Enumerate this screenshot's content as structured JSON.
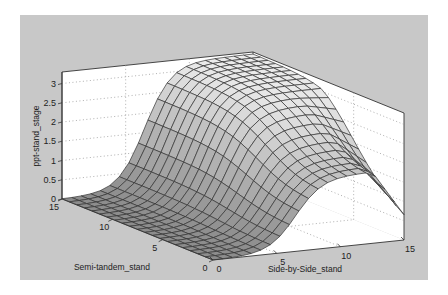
{
  "chart_data": {
    "type": "surface3d",
    "title": "",
    "xlabel": "Side-by-Side_stand",
    "ylabel": "Semi-tandem_stand",
    "zlabel": "ppt-stand_stage",
    "xlim": [
      0,
      15
    ],
    "ylim": [
      0,
      15
    ],
    "zlim": [
      0,
      3.3
    ],
    "x_ticks": [
      "0",
      "5",
      "10",
      "15"
    ],
    "y_ticks": [
      "0",
      "5",
      "10",
      "15"
    ],
    "z_ticks": [
      "0",
      "0.5",
      "1",
      "1.5",
      "2",
      "2.5",
      "3"
    ],
    "grid": true,
    "grid_style": "dotted",
    "grid_resolution": 21,
    "sample_values": [
      {
        "side_by_side": 0,
        "semi_tandem": 0,
        "z": 0.0
      },
      {
        "side_by_side": 0,
        "semi_tandem": 15,
        "z": 0.0
      },
      {
        "side_by_side": 5,
        "semi_tandem": 5,
        "z": 0.3
      },
      {
        "side_by_side": 7.5,
        "semi_tandem": 10,
        "z": 1.6
      },
      {
        "side_by_side": 10,
        "semi_tandem": 15,
        "z": 3.2
      },
      {
        "side_by_side": 15,
        "semi_tandem": 15,
        "z": 3.2
      },
      {
        "side_by_side": 15,
        "semi_tandem": 5,
        "z": 1.5
      },
      {
        "side_by_side": 15,
        "semi_tandem": 0,
        "z": 0.9
      }
    ]
  },
  "colors": {
    "figure_background": "#c8c8c8",
    "axes_background": "#ffffff",
    "surface_light": "#e6e6e6",
    "surface_dark": "#5a5a5a",
    "mesh_line": "#333333",
    "grid_line": "#9a9a9a"
  }
}
